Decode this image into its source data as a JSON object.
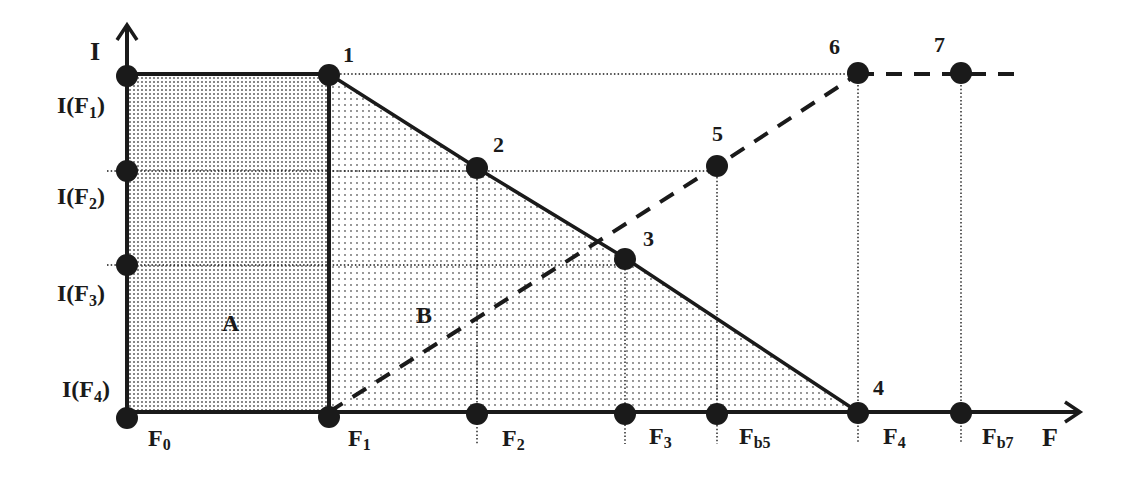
{
  "axes": {
    "y_label": "I",
    "x_label": "F"
  },
  "y_ticks": [
    {
      "id": "IF1",
      "base": "I(F",
      "sub": "1",
      "close": ")"
    },
    {
      "id": "IF2",
      "base": "I(F",
      "sub": "2",
      "close": ")"
    },
    {
      "id": "IF3",
      "base": "I(F",
      "sub": "3",
      "close": ")"
    },
    {
      "id": "IF4",
      "base": "I(F",
      "sub": "4",
      "close": ")"
    }
  ],
  "x_ticks": [
    {
      "id": "F0",
      "base": "F",
      "sub": "0"
    },
    {
      "id": "F1",
      "base": "F",
      "sub": "1"
    },
    {
      "id": "F2",
      "base": "F",
      "sub": "2"
    },
    {
      "id": "F3",
      "base": "F",
      "sub": "3"
    },
    {
      "id": "Fb5",
      "base": "F",
      "sub": "b5"
    },
    {
      "id": "F4",
      "base": "F",
      "sub": "4"
    },
    {
      "id": "Fb7",
      "base": "F",
      "sub": "b7"
    }
  ],
  "points": [
    {
      "label": "1"
    },
    {
      "label": "2"
    },
    {
      "label": "3"
    },
    {
      "label": "4"
    },
    {
      "label": "5"
    },
    {
      "label": "6"
    },
    {
      "label": "7"
    }
  ],
  "regions": {
    "A": "A",
    "B": "B"
  },
  "colors": {
    "ink": "#1a1a1a",
    "background": "#ffffff",
    "region_a_dot": "#555555",
    "region_b_dot": "#666666"
  }
}
